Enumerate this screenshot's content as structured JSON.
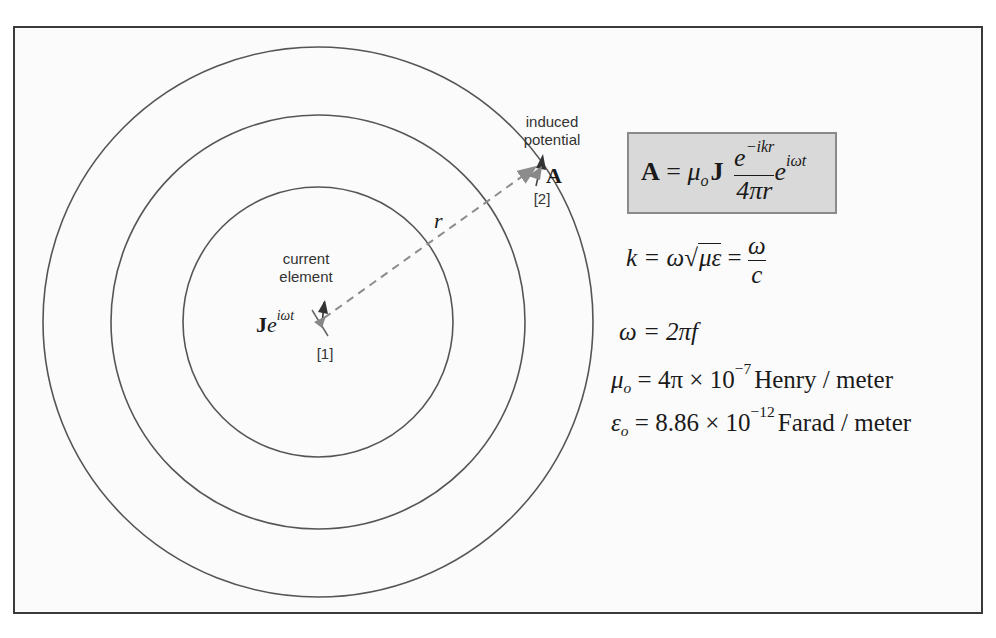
{
  "diagram": {
    "labels": {
      "current_element": [
        "current",
        "element"
      ],
      "induced_potential": [
        "induced",
        "potential"
      ],
      "point1": "[1]",
      "point2": "[2]",
      "r": "r",
      "source_J": "J",
      "source_e": "e",
      "source_exp": "iωt",
      "A": "A"
    },
    "circles": [
      {
        "name": "inner",
        "cx": 318,
        "cy": 322,
        "r": 135
      },
      {
        "name": "middle",
        "cx": 318,
        "cy": 322,
        "r": 207
      },
      {
        "name": "outer",
        "cx": 318,
        "cy": 322,
        "r": 275
      }
    ],
    "vector_r": {
      "from": [
        322,
        320
      ],
      "to": [
        538,
        166
      ],
      "style": "dashed"
    },
    "colors": {
      "circle": "#555555",
      "dashed": "#8c8c8c",
      "eq_box_fill": "#d9d9d9",
      "eq_box_border": "#8a8a8a",
      "frame": "#3a3a3a"
    }
  },
  "equations": {
    "boxed": {
      "lhs": "A",
      "eq": "=",
      "mu": "μ",
      "mu_sub": "o",
      "J": "J",
      "num_base": "e",
      "num_exp": "−ikr",
      "den": "4πr",
      "tail_base": "e",
      "tail_exp": "iωt"
    },
    "k": {
      "lhs": "k",
      "eq1": " = ω",
      "sqrt_content": "με",
      "eq2": " = ",
      "frac_num": "ω",
      "frac_den": "c"
    },
    "omega": {
      "text": "ω = 2πf"
    },
    "mu0": {
      "sym": "μ",
      "sub": "o",
      "mid": " = 4π × 10",
      "exp": "−7",
      "unit": "Henry / meter"
    },
    "eps0": {
      "sym": "ε",
      "sub": "o",
      "mid": " = 8.86 × 10",
      "exp": "−12",
      "unit": "Farad / meter"
    }
  }
}
